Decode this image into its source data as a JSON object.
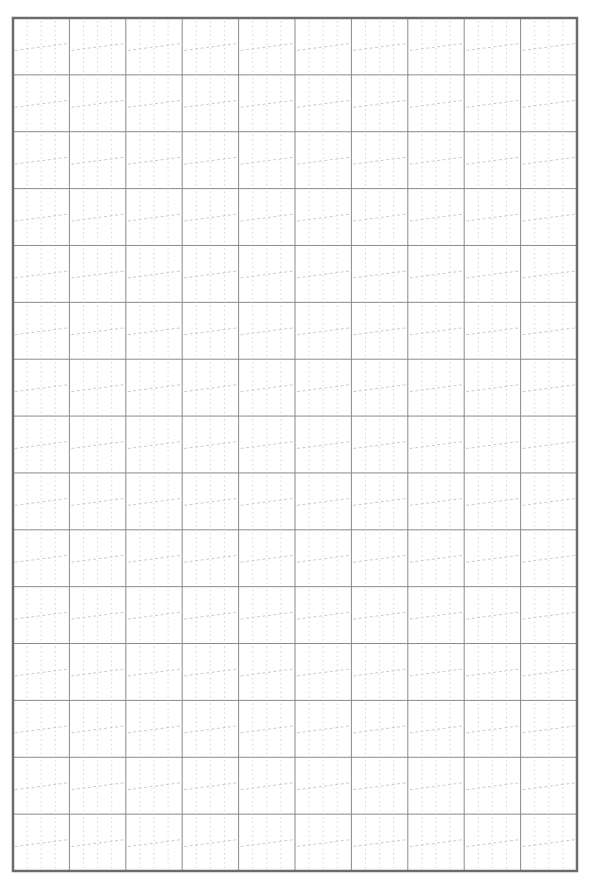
{
  "page": {
    "width": 591,
    "height": 880,
    "background": "#ffffff"
  },
  "grid": {
    "type": "handwriting-practice-grid",
    "left": 13,
    "top": 18,
    "right": 577,
    "bottom": 871,
    "columns": 10,
    "rows": 15,
    "colors": {
      "border": "#6b6b6b",
      "cell_line": "#8a8a8a",
      "guide_dotted": "#cfcfcf",
      "guide_dashed": "#c4c4c4"
    },
    "stroke_widths": {
      "border": 2.5,
      "cell_line": 1,
      "guide": 0.9
    },
    "cell_guides": {
      "vertical_dotted_fractions": [
        0.25,
        0.5,
        0.75
      ],
      "slanted_dashed": {
        "left_y_fraction": 0.57,
        "right_y_fraction": 0.45
      }
    }
  }
}
